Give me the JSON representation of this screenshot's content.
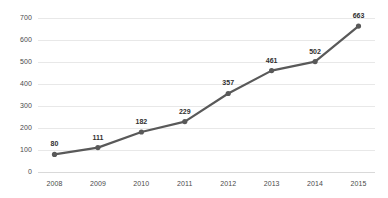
{
  "chart_data": {
    "type": "line",
    "title": "",
    "subtitle": "",
    "xlabel": "",
    "ylabel": "",
    "categories": [
      "2008",
      "2009",
      "2010",
      "2011",
      "2012",
      "2013",
      "2014",
      "2015"
    ],
    "values": [
      80,
      111,
      182,
      229,
      357,
      461,
      502,
      663
    ],
    "point_labels": [
      "80",
      "111",
      "182",
      "229",
      "357",
      "461",
      "502",
      "663"
    ],
    "ylim": [
      0,
      700
    ],
    "ytick_values": [
      0,
      100,
      200,
      300,
      400,
      500,
      600,
      700
    ],
    "ytick_labels": [
      "0",
      "100",
      "200",
      "300",
      "400",
      "500",
      "600",
      "700"
    ],
    "grid": true,
    "grid_axis": "y",
    "legend": false,
    "legend_position": "none",
    "series": [
      {
        "name": "",
        "values": [
          80,
          111,
          182,
          229,
          357,
          461,
          502,
          663
        ],
        "line_color": "#595959",
        "marker_color": "#595959",
        "marker": "circle"
      }
    ],
    "colors": {
      "line": "#595959",
      "marker": "#595959",
      "grid": "#e8e8e8",
      "axis": "#d9d9d9",
      "tick_text": "#4a4a4a",
      "label_text": "#2f2f2f",
      "background": "#ffffff"
    }
  }
}
